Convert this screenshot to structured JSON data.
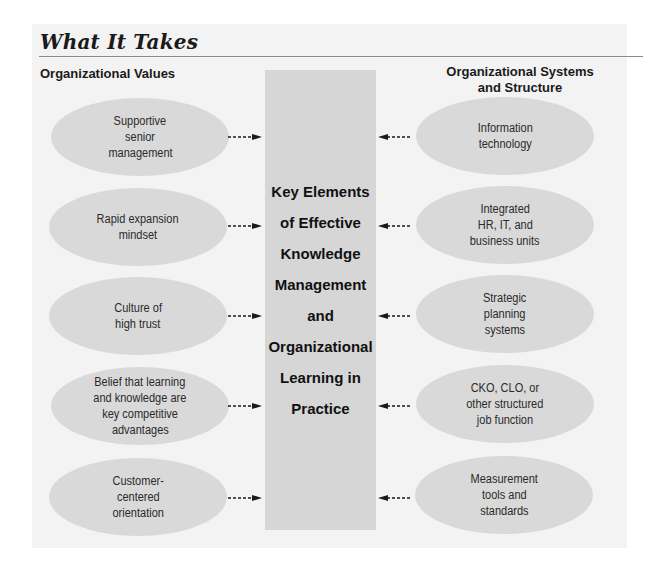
{
  "title": "What It Takes",
  "left_column": {
    "heading": "Organizational Values",
    "items": [
      {
        "lines": [
          "Supportive",
          "senior",
          "management"
        ]
      },
      {
        "lines": [
          "Rapid expansion",
          "mindset"
        ]
      },
      {
        "lines": [
          "Culture of",
          "high trust"
        ]
      },
      {
        "lines": [
          "Belief that learning",
          "and knowledge are",
          "key competitive",
          "advantages"
        ]
      },
      {
        "lines": [
          "Customer-",
          "centered",
          "orientation"
        ]
      }
    ]
  },
  "right_column": {
    "heading_lines": [
      "Organizational Systems",
      "and Structure"
    ],
    "items": [
      {
        "lines": [
          "Information",
          "technology"
        ]
      },
      {
        "lines": [
          "Integrated",
          "HR, IT, and",
          "business units"
        ]
      },
      {
        "lines": [
          "Strategic",
          "planning",
          "systems"
        ]
      },
      {
        "lines": [
          "CKO, CLO, or",
          "other structured",
          "job function"
        ]
      },
      {
        "lines": [
          "Measurement",
          "tools and",
          "standards"
        ]
      }
    ]
  },
  "center": {
    "lines": [
      "Key Elements",
      "of Effective",
      "Knowledge",
      "Management",
      "and",
      "Organizational",
      "Learning in",
      "Practice"
    ]
  },
  "arrows": {
    "style": "dashed",
    "direction": "toward-center",
    "color": "#1a1a1a"
  },
  "colors": {
    "panel_bg": "#f3f3f3",
    "center_box": "#d6d6d6",
    "ellipse": "#d9d9d9"
  }
}
